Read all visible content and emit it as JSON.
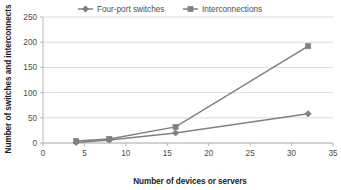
{
  "chart_data": {
    "type": "line",
    "title": "",
    "xlabel": "Number of devices or servers",
    "ylabel": "Number of switches and interconnects",
    "x": [
      4,
      8,
      16,
      32
    ],
    "series": [
      {
        "name": "Four-port switches",
        "values": [
          1,
          6,
          20,
          58
        ],
        "marker": "diamond",
        "color": "#808080"
      },
      {
        "name": "Interconnections",
        "values": [
          4,
          8,
          32,
          192
        ],
        "marker": "square",
        "color": "#808080"
      }
    ],
    "xlim": [
      0,
      35
    ],
    "ylim": [
      0,
      250
    ],
    "xticks": [
      0,
      5,
      10,
      15,
      20,
      25,
      30,
      35
    ],
    "yticks": [
      0,
      50,
      100,
      150,
      200,
      250
    ],
    "xtick_labels": [
      "0",
      "5",
      "10",
      "15",
      "20",
      "25",
      "30",
      "35"
    ],
    "ytick_labels": [
      "0",
      "50",
      "100",
      "150",
      "200",
      "250"
    ],
    "grid": "horizontal",
    "legend_position": "top-center",
    "colors": {
      "grid": "#d4d4d4",
      "axis": "#b0b0b0",
      "line": "#808080",
      "text": "#4d4d4d",
      "title_text": "#1a1a1a",
      "background": "#ffffff"
    }
  },
  "legend": {
    "entries": [
      {
        "label": "Four-port switches",
        "marker": "diamond-marker-icon"
      },
      {
        "label": "Interconnections",
        "marker": "square-marker-icon"
      }
    ]
  },
  "axes": {
    "x_title": "Number of devices or servers",
    "y_title": "Number of switches and interconnects"
  }
}
